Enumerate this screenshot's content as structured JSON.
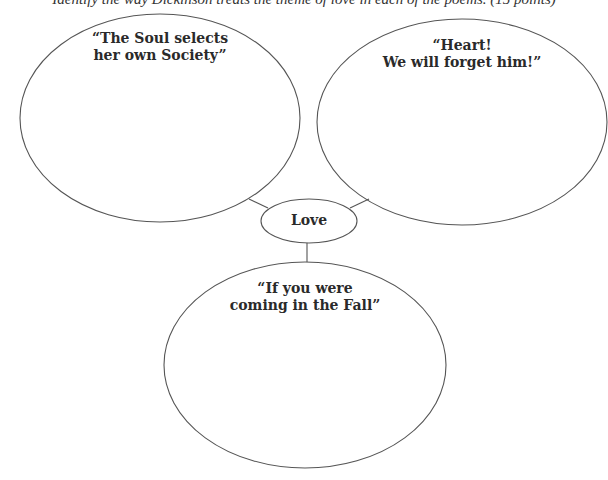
{
  "instructions": "Identify the way Dickinson treats the theme of love in each of the poems. (15 points)",
  "diagram": {
    "center": {
      "label": "Love"
    },
    "nodes": [
      {
        "id": "soul",
        "line1": "“The Soul selects",
        "line2": "her own Society”"
      },
      {
        "id": "heart",
        "line1": "“Heart!",
        "line2": "We will forget him!”"
      },
      {
        "id": "fall",
        "line1": "“If you were",
        "line2": "coming in the Fall”"
      }
    ]
  },
  "colors": {
    "stroke": "#555555",
    "text": "#2a2a2a",
    "background": "#ffffff"
  }
}
